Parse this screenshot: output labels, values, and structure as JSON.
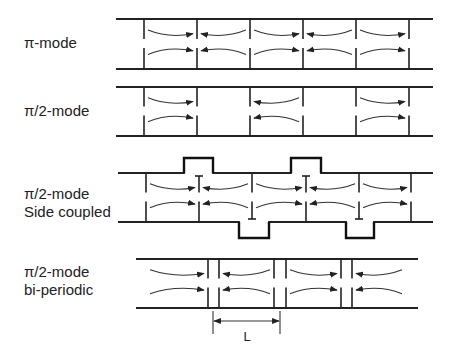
{
  "diagram": {
    "rows": [
      {
        "id": "pi-mode",
        "label_lines": [
          "π-mode"
        ],
        "top_y": 19,
        "bottom_y": 69,
        "pipe_x": [
          116,
          433
        ],
        "walls": [
          144,
          197,
          250,
          303,
          356,
          409
        ],
        "cells": [
          {
            "top": "right",
            "bottom": "right"
          },
          {
            "top": "left",
            "bottom": "left"
          },
          {
            "top": "right",
            "bottom": "right"
          },
          {
            "top": "left",
            "bottom": "left"
          },
          {
            "top": "right",
            "bottom": "right"
          }
        ]
      },
      {
        "id": "pi-half-mode",
        "label_lines": [
          "π/2-mode"
        ],
        "top_y": 87,
        "bottom_y": 136,
        "pipe_x": [
          116,
          433
        ],
        "walls": [
          144,
          197,
          250,
          303,
          356,
          409
        ],
        "cells": [
          {
            "top": "right",
            "bottom": "right"
          },
          {
            "top": "none",
            "bottom": "none"
          },
          {
            "top": "left",
            "bottom": "left"
          },
          {
            "top": "none",
            "bottom": "none"
          },
          {
            "top": "right",
            "bottom": "right"
          }
        ]
      },
      {
        "id": "pi-half-mode-side-coupled",
        "label_lines": [
          "π/2-mode",
          "Side coupled"
        ],
        "top_y": 173,
        "bottom_y": 222,
        "pipe_x": [
          118,
          433
        ],
        "walls": [
          146,
          199,
          252,
          306,
          359,
          411
        ],
        "coupling_cavities_top": [
          [
            184,
            213
          ],
          [
            291,
            321
          ]
        ],
        "coupling_cavities_bottom": [
          [
            239,
            269
          ],
          [
            346,
            374
          ]
        ],
        "cells": [
          {
            "top": "right",
            "bottom": "right"
          },
          {
            "top": "left",
            "bottom": "left"
          },
          {
            "top": "right",
            "bottom": "right"
          },
          {
            "top": "left",
            "bottom": "left"
          },
          {
            "top": "right",
            "bottom": "right"
          }
        ]
      },
      {
        "id": "pi-half-mode-bi-periodic",
        "label_lines": [
          "π/2-mode",
          "bi-periodic"
        ],
        "top_y": 259,
        "bottom_y": 308,
        "pipe_x": [
          136,
          418
        ],
        "double_walls": [
          [
            208,
            219
          ],
          [
            274,
            286
          ],
          [
            341,
            352
          ]
        ],
        "cells": [
          {
            "top": "right",
            "bottom": "right"
          },
          {
            "top": "left",
            "bottom": "left"
          },
          {
            "top": "right",
            "bottom": "right"
          },
          {
            "top": "left",
            "bottom": "left"
          }
        ]
      }
    ],
    "dimension": {
      "label": "L",
      "x1": 213,
      "x2": 280,
      "y": 321,
      "tick_top": 311,
      "tick_bottom": 334
    }
  }
}
